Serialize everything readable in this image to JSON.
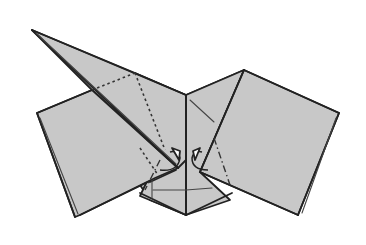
{
  "diagram": {
    "type": "origami-step-diagram",
    "colors": {
      "paper": "#c8c8c8",
      "lines": "#222222",
      "background": "#ffffff"
    },
    "elements": [
      {
        "name": "back-body-layer",
        "kind": "paper-region"
      },
      {
        "name": "long-point-flap",
        "kind": "paper-region"
      },
      {
        "name": "left-square-flap",
        "kind": "paper-region"
      },
      {
        "name": "right-square-flap",
        "kind": "paper-region"
      },
      {
        "name": "center-crease",
        "kind": "edge"
      },
      {
        "name": "valley-fold-lines",
        "kind": "dotted-fold-line"
      },
      {
        "name": "mountain-fold-lines",
        "kind": "dash-dot-fold-line"
      },
      {
        "name": "left-rotate-arrow",
        "kind": "fold-arrow"
      },
      {
        "name": "right-rotate-arrow",
        "kind": "fold-arrow"
      }
    ]
  }
}
